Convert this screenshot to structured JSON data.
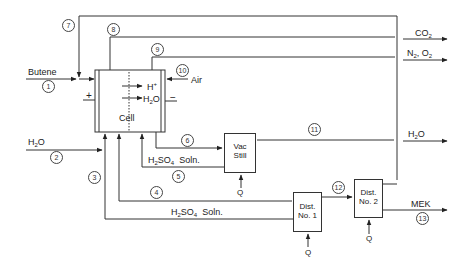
{
  "diagram": {
    "type": "process-flow",
    "units": {
      "cell": {
        "label": "Cell",
        "ion": "H",
        "ion_sup": "+",
        "water": "H",
        "water_sub": "2",
        "water_tail": "O",
        "plus": "+",
        "minus": "−"
      },
      "vac_still": {
        "line1": "Vac",
        "line2": "Still"
      },
      "dist1": {
        "line1": "Dist.",
        "line2": "No. 1"
      },
      "dist2": {
        "line1": "Dist.",
        "line2": "No. 2"
      },
      "heat": "Q"
    },
    "inputs": {
      "butene": "Butene",
      "water": {
        "a": "H",
        "sub": "2",
        "b": "O"
      },
      "air": "Air"
    },
    "outputs": {
      "co2": {
        "a": "CO",
        "sub": "2"
      },
      "n2o2": {
        "a": "N",
        "sub1": "2",
        "b": ", O",
        "sub2": "2"
      },
      "water": {
        "a": "H",
        "sub": "2",
        "b": "O"
      },
      "mek": "MEK"
    },
    "solution_labels": {
      "h2so4_a": {
        "a": "H",
        "sub1": "2",
        "b": "SO",
        "sub2": "4",
        "c": "  Soln."
      },
      "h2so4_b": {
        "a": "H",
        "sub1": "2",
        "b": "SO",
        "sub2": "4",
        "c": "  Soln."
      }
    },
    "stream_numbers": [
      "1",
      "2",
      "3",
      "4",
      "5",
      "6",
      "7",
      "8",
      "9",
      "10",
      "11",
      "12",
      "13"
    ]
  }
}
